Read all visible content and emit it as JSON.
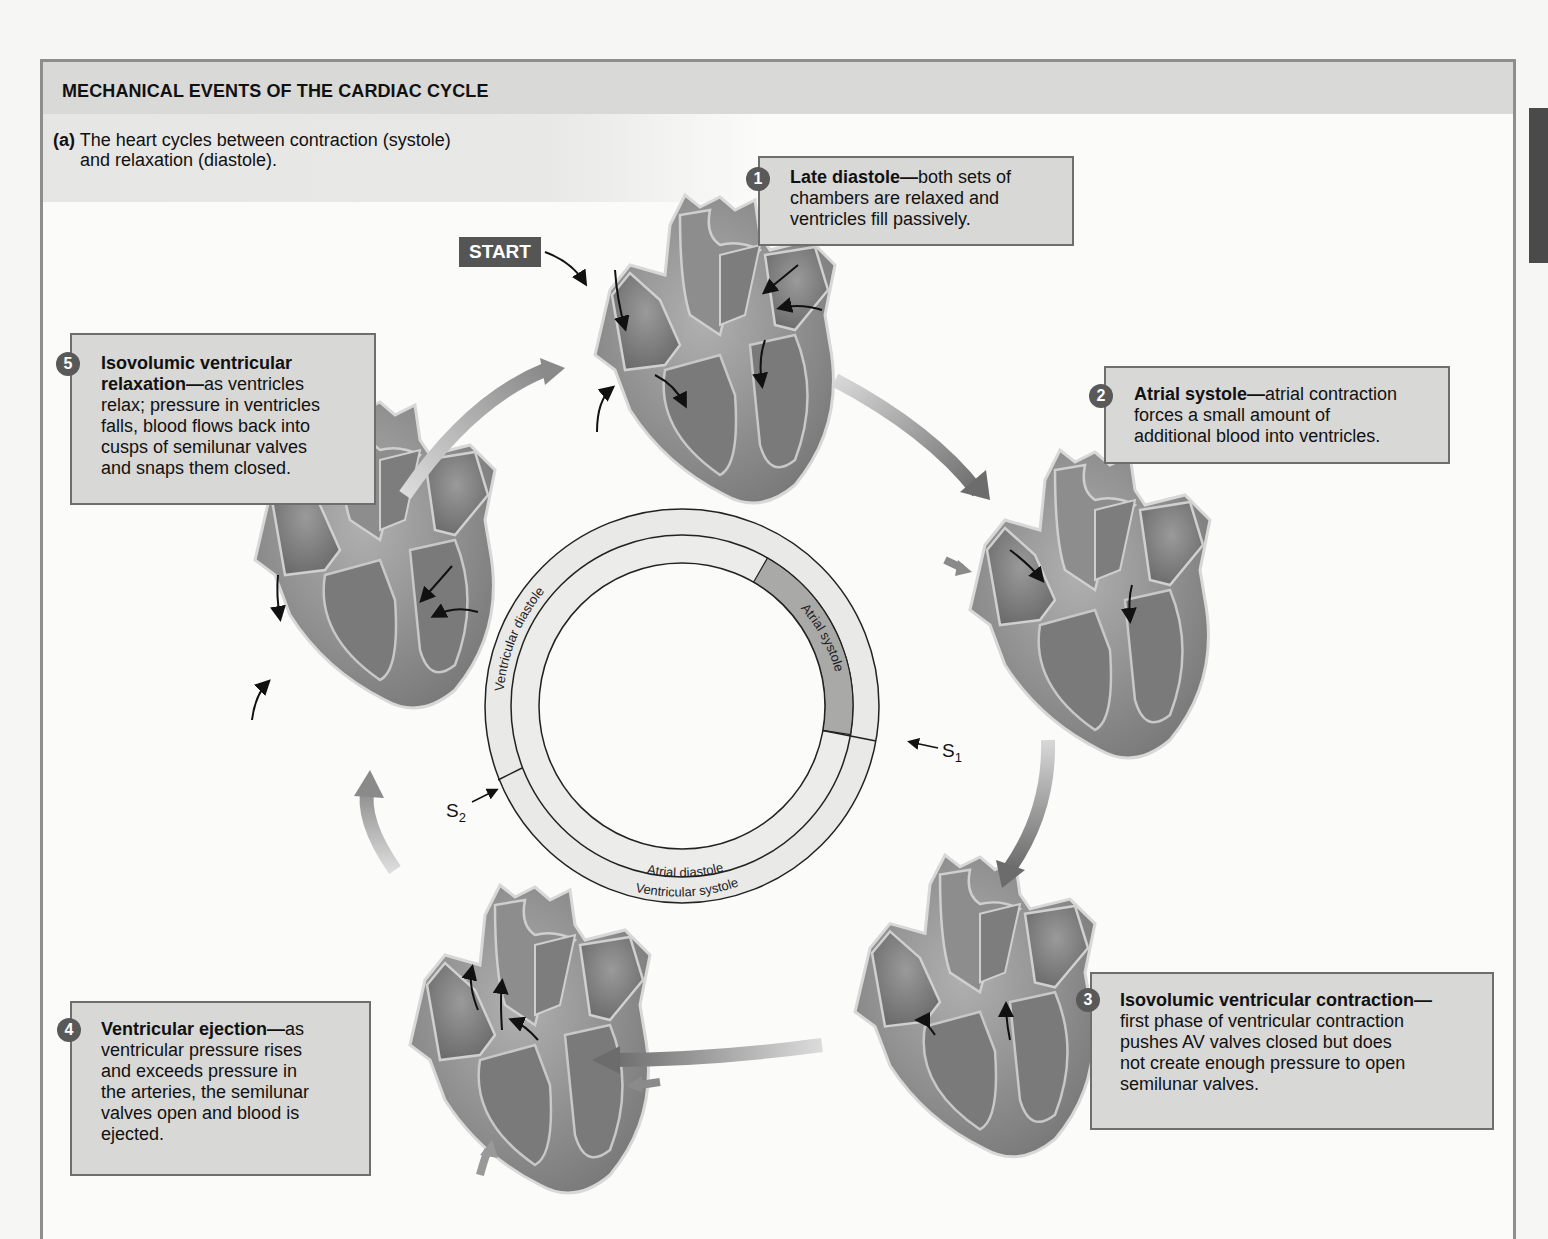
{
  "figure": {
    "title": "MECHANICAL EVENTS OF THE CARDIAC CYCLE",
    "part_label": "(a)",
    "subtitle": "The heart cycles between contraction (systole) and relaxation (diastole).",
    "subtitle_line1": "The heart cycles between contraction (systole)",
    "subtitle_line2": "and relaxation (diastole).",
    "start_label": "START"
  },
  "steps": [
    {
      "number": "1",
      "heading": "Late diastole",
      "text": "both sets of chambers are relaxed and ventricles fill passively.",
      "lines": [
        "both sets of",
        "chambers are relaxed and",
        "ventricles fill passively."
      ]
    },
    {
      "number": "2",
      "heading": "Atrial systole",
      "text": "atrial contraction forces a small amount of additional blood into ventricles.",
      "lines": [
        "atrial contraction",
        "forces a small amount of",
        "additional blood into ventricles."
      ]
    },
    {
      "number": "3",
      "heading": "Isovolumic ventricular contraction",
      "text": "first phase of ventricular contraction pushes AV valves closed but does not create enough pressure to open semilunar valves.",
      "lines": [
        "",
        "first phase of ventricular contraction",
        "pushes AV valves closed but does",
        "not create enough pressure to open",
        "semilunar valves."
      ]
    },
    {
      "number": "4",
      "heading": "Ventricular ejection",
      "text": "as ventricular pressure rises and exceeds pressure in the arteries, the semilunar valves open and blood is ejected.",
      "lines": [
        "as",
        "ventricular pressure rises",
        "and exceeds pressure in",
        "the arteries, the semilunar",
        "valves open and blood is",
        "ejected."
      ]
    },
    {
      "number": "5",
      "heading_line1": "Isovolumic ventricular",
      "heading_line2": "relaxation",
      "heading": "Isovolumic ventricular relaxation",
      "text": "as ventricles relax; pressure in ventricles falls, blood flows back into cusps of semilunar valves and snaps them closed.",
      "lines": [
        "as ventricles",
        "relax; pressure in ventricles",
        "falls, blood flows back into",
        "cusps of semilunar valves",
        "and snaps them closed."
      ]
    }
  ],
  "ring": {
    "outer_top_label": "Ventricular diastole",
    "outer_bottom_label": "Ventricular systole",
    "inner_right_label": "Atrial systole",
    "inner_bottom_label": "Atrial diastole",
    "heart_sound_1": "S",
    "heart_sound_1_sub": "1",
    "heart_sound_2": "S",
    "heart_sound_2_sub": "2"
  },
  "colors": {
    "panel_border": "#8e8e8e",
    "title_bar": "#d9d9d8",
    "callout_fill": "#d8d8d7",
    "callout_border": "#6e6e6e",
    "badge": "#595959",
    "ring_fill": "#e9e9e8",
    "atrial_systole_fill": "#a9a9a8",
    "heart_fill": "#8a8a8a"
  }
}
